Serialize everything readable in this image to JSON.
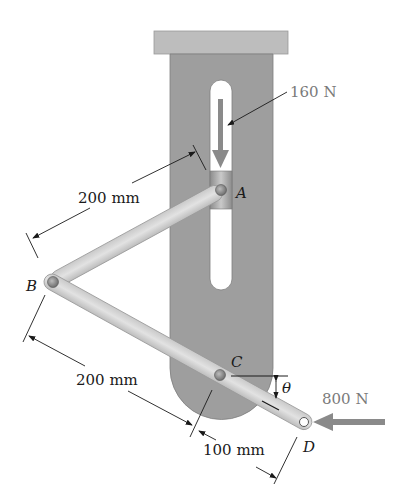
{
  "figure": {
    "labels": {
      "pin_a": "A",
      "pin_b": "B",
      "pin_c": "C",
      "pin_d": "D",
      "angle": "θ"
    },
    "forces": {
      "vertical_force": "160 N",
      "horizontal_force": "800 N"
    },
    "dimensions": {
      "ab_length": "200 mm",
      "bc_length": "200 mm",
      "cd_length": "100 mm"
    },
    "colors": {
      "plate": "#9e9e9e",
      "top_support": "#bdbdbd",
      "links": "#dedede",
      "force_arrow": "#8a8a8a",
      "text": "#1a1a1a"
    }
  }
}
